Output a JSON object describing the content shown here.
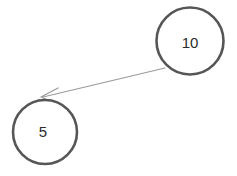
{
  "diagram": {
    "type": "directed-graph",
    "background_color": "#ffffff",
    "canvas": {
      "width": 237,
      "height": 176
    },
    "node_style": {
      "shape": "circle",
      "stroke_color": "#565656",
      "stroke_width": 2.6,
      "fill_color": "#ffffff",
      "label_color": "#2b2b2b",
      "label_font_size": 15
    },
    "edge_style": {
      "stroke_color": "#9a9a9a",
      "stroke_width": 1.2,
      "arrowhead": "open-v",
      "arrowhead_color": "#9a9a9a"
    },
    "nodes": [
      {
        "id": "node-10",
        "label": "10",
        "cx": 190,
        "cy": 41,
        "r": 33.5,
        "label_x": 190,
        "label_y": 42
      },
      {
        "id": "node-5",
        "label": "5",
        "cx": 45,
        "cy": 132,
        "r": 32,
        "label_x": 43,
        "label_y": 131
      }
    ],
    "edges": [
      {
        "id": "edge-10-to-5",
        "from": "node-10",
        "to": "node-5",
        "label": "",
        "x1": 165,
        "y1": 68,
        "x2": 43,
        "y2": 97,
        "arrow_tip_x": 41,
        "arrow_tip_y": 97,
        "arrow_wing_1_x": 58,
        "arrow_wing_1_y": 88,
        "arrow_wing_2_x": 57,
        "arrow_wing_2_y": 104
      }
    ]
  }
}
